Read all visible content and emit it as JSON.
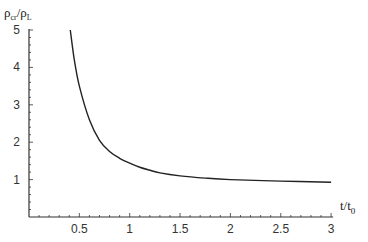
{
  "chart_data": {
    "type": "line",
    "title": "",
    "xlabel": "t/t0",
    "ylabel": "ρcr/ρL",
    "xlim": [
      0,
      3
    ],
    "ylim": [
      0,
      5
    ],
    "x_ticks": [
      "0.5",
      "1",
      "1.5",
      "2",
      "2.5",
      "3"
    ],
    "y_ticks": [
      "1",
      "2",
      "3",
      "4",
      "5"
    ],
    "grid": false,
    "legend": null,
    "series": [
      {
        "name": "ρcr/ρL",
        "x": [
          0.41,
          0.45,
          0.5,
          0.6,
          0.7,
          0.8,
          0.9,
          1.0,
          1.1,
          1.2,
          1.3,
          1.5,
          1.75,
          2.0,
          2.5,
          3.0
        ],
        "values": [
          5.0,
          4.2,
          3.5,
          2.6,
          2.05,
          1.75,
          1.57,
          1.44,
          1.33,
          1.25,
          1.18,
          1.1,
          1.04,
          1.0,
          0.96,
          0.93
        ]
      }
    ]
  },
  "labels": {
    "ylabel_main": "ρ",
    "ylabel_sub1": "cr",
    "ylabel_slash": "/",
    "ylabel_main2": "ρ",
    "ylabel_sub2": "L",
    "xlabel_main": "t/t",
    "xlabel_sub": "0"
  },
  "colors": {
    "axis": "#333333",
    "curve": "#222222"
  }
}
